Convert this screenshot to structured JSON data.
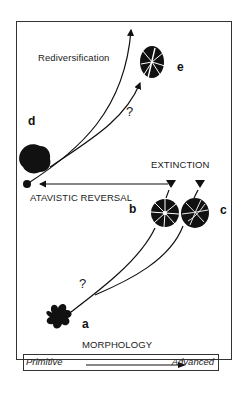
{
  "labels": {
    "rediversification": "Rediversification",
    "extinction": "EXTINCTION",
    "atavistic_reversal": "ATAVISTIC REVERSAL",
    "morphology": "MORPHOLOGY",
    "question_upper": "?",
    "question_lower": "?"
  },
  "specimens": [
    {
      "id": "a",
      "label": "a"
    },
    {
      "id": "b",
      "label": "b"
    },
    {
      "id": "c",
      "label": "c"
    },
    {
      "id": "d",
      "label": "d"
    },
    {
      "id": "e",
      "label": "e"
    }
  ],
  "axis": {
    "left": "Primitive",
    "right": "Advanced"
  }
}
